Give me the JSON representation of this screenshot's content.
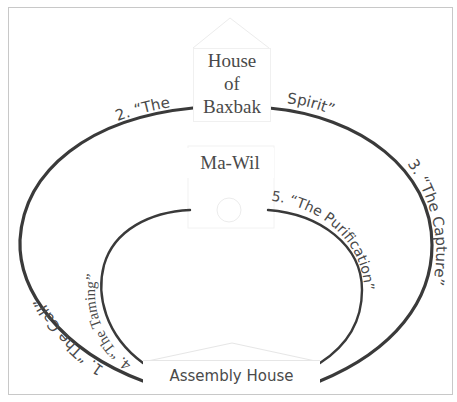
{
  "diagram": {
    "buildings": {
      "top": {
        "lines": [
          "House",
          "of",
          "Baxbak"
        ]
      },
      "center": {
        "label": "Ma-Wil"
      },
      "bottom": {
        "label": "Assembly House"
      }
    },
    "stages": [
      {
        "number": "1.",
        "name": "“The Call”",
        "arc": "outer",
        "position": "left"
      },
      {
        "number": "2.",
        "name": "“The Baxbak Spirit”",
        "arc": "outer",
        "position": "top",
        "parts": [
          "2. “The",
          "Spirit”"
        ]
      },
      {
        "number": "3.",
        "name": "“The Capture”",
        "arc": "outer",
        "position": "right"
      },
      {
        "number": "4.",
        "name": "“The Taming”",
        "arc": "inner",
        "position": "left"
      },
      {
        "number": "5.",
        "name": "“The Purification”",
        "arc": "inner",
        "position": "right"
      }
    ],
    "labels": {
      "stage1": "1. “The Call”",
      "stage2a": "2. “The",
      "stage2b": "Spirit”",
      "stage3": "3. “The Capture”",
      "stage4": "4. “The Taming”",
      "stage5": "5. “The Purification”"
    },
    "colors": {
      "arc": "#3a3a3a",
      "text": "#4a4a4a",
      "frame": "#c8c8c8",
      "faint": "#e4e4e4"
    }
  }
}
